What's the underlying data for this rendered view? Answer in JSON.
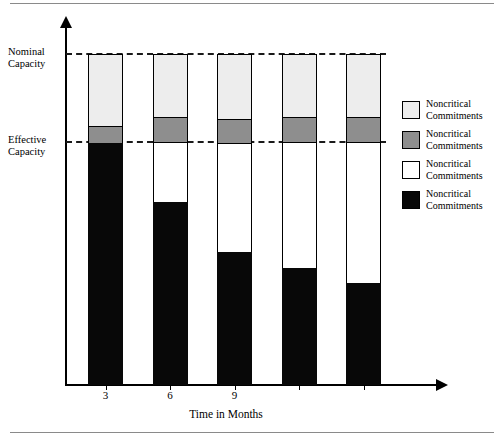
{
  "chart_data": {
    "type": "bar",
    "subtype": "stacked-bar",
    "title": "",
    "xlabel": "Time in Months",
    "ylabel": "",
    "categories": [
      "3",
      "6",
      "9",
      "",
      ""
    ],
    "tick_labels": [
      "3",
      "6",
      "9"
    ],
    "grid": false,
    "legend_position": "right",
    "reference_lines": [
      {
        "name": "nominal-capacity",
        "label_line1": "Nominal",
        "label_line2": "Capacity",
        "value": 100,
        "style": "dashed"
      },
      {
        "name": "effective-capacity",
        "label_line1": "Effective",
        "label_line2": "Capacity",
        "value": 73.5,
        "style": "dashed"
      }
    ],
    "ylim": [
      0,
      100
    ],
    "series": [
      {
        "name": "Noncritical Commitments",
        "swatch_key": "nominal_top",
        "color": "#ededed",
        "values": [
          21.7,
          26.5,
          26.8,
          26.5,
          26.5
        ]
      },
      {
        "name": "Noncritical Commitments",
        "swatch_key": "buffer",
        "color": "#8e8e8e",
        "values": [
          5.1,
          0.0,
          0.0,
          0.0,
          0.0
        ]
      },
      {
        "name": "Noncritical Commitments",
        "swatch_key": "slack",
        "color": "#ffffff",
        "values": [
          0.0,
          18.1,
          33.1,
          38.0,
          42.7
        ]
      },
      {
        "name": "Noncritical Commitments",
        "swatch_key": "committed",
        "color": "#080808",
        "values": [
          73.2,
          55.4,
          40.1,
          35.5,
          30.8
        ]
      }
    ],
    "bars": [
      {
        "category": "3",
        "segments": [
          {
            "key": "nominal_top",
            "height_pct": 21.7
          },
          {
            "key": "buffer",
            "height_pct": 5.1
          },
          {
            "key": "slack",
            "height_pct": 0.0
          },
          {
            "key": "committed",
            "height_pct": 73.2
          }
        ]
      },
      {
        "category": "6",
        "segments": [
          {
            "key": "nominal_top",
            "height_pct": 19.0
          },
          {
            "key": "buffer",
            "height_pct": 7.5
          },
          {
            "key": "slack",
            "height_pct": 18.1
          },
          {
            "key": "committed",
            "height_pct": 55.4
          }
        ]
      },
      {
        "category": "9",
        "segments": [
          {
            "key": "nominal_top",
            "height_pct": 19.6
          },
          {
            "key": "buffer",
            "height_pct": 7.2
          },
          {
            "key": "slack",
            "height_pct": 33.1
          },
          {
            "key": "committed",
            "height_pct": 40.1
          }
        ]
      },
      {
        "category": "",
        "segments": [
          {
            "key": "nominal_top",
            "height_pct": 19.0
          },
          {
            "key": "buffer",
            "height_pct": 7.5
          },
          {
            "key": "slack",
            "height_pct": 38.0
          },
          {
            "key": "committed",
            "height_pct": 35.5
          }
        ]
      },
      {
        "category": "",
        "segments": [
          {
            "key": "nominal_top",
            "height_pct": 19.0
          },
          {
            "key": "buffer",
            "height_pct": 7.5
          },
          {
            "key": "slack",
            "height_pct": 42.7
          },
          {
            "key": "committed",
            "height_pct": 30.8
          }
        ]
      }
    ]
  },
  "axis": {
    "x_title": "Time in Months",
    "ticks": [
      {
        "label": "3"
      },
      {
        "label": "6"
      },
      {
        "label": "9"
      },
      {
        "label": ""
      },
      {
        "label": ""
      }
    ]
  },
  "reference": {
    "nominal": {
      "line1": "Nominal",
      "line2": "Capacity"
    },
    "effective": {
      "line1": "Effective",
      "line2": "Capacity"
    }
  },
  "legend": {
    "entries": [
      {
        "line1": "Noncritical",
        "line2": "Commitments",
        "color": "#ededed"
      },
      {
        "line1": "Noncritical",
        "line2": "Commitments",
        "color": "#8e8e8e"
      },
      {
        "line1": "Noncritical",
        "line2": "Commitments",
        "color": "#ffffff"
      },
      {
        "line1": "Noncritical",
        "line2": "Commitments",
        "color": "#080808"
      }
    ]
  },
  "colors": {
    "nominal_top": "#ededed",
    "buffer": "#8e8e8e",
    "slack": "#ffffff",
    "committed": "#080808",
    "axis": "#000000",
    "rule": "#8a8a8a"
  }
}
